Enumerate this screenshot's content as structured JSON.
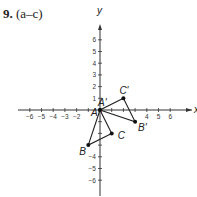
{
  "header": {
    "number": "9.",
    "parts": "(a–c)"
  },
  "chart_data": {
    "type": "scatter",
    "title": "9. (a–c)",
    "xlabel": "x",
    "ylabel": "y",
    "xlim": [
      -6,
      6
    ],
    "ylim": [
      -6,
      6
    ],
    "x_ticks": [
      -6,
      -5,
      -4,
      -3,
      -2,
      4,
      5,
      6
    ],
    "y_ticks": [
      6,
      5,
      4,
      3,
      2,
      1,
      -4,
      -5,
      -6
    ],
    "grid": false,
    "series": [
      {
        "name": "Triangle ABC",
        "points": [
          {
            "label": "A",
            "x": 0,
            "y": 0
          },
          {
            "label": "B",
            "x": -1,
            "y": -3
          },
          {
            "label": "C",
            "x": 1,
            "y": -2
          }
        ]
      },
      {
        "name": "Triangle A'B'C'",
        "points": [
          {
            "label": "A'",
            "x": 0,
            "y": 0
          },
          {
            "label": "B'",
            "x": 3,
            "y": -1
          },
          {
            "label": "C'",
            "x": 2,
            "y": 1
          }
        ]
      }
    ]
  }
}
